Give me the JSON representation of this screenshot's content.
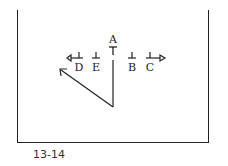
{
  "diagram": {
    "caption": "13-14",
    "players": [
      {
        "label": "A",
        "x": 113,
        "y": 43,
        "marker": "T"
      },
      {
        "label": "D",
        "x": 79,
        "y": 71,
        "marker": "⊥"
      },
      {
        "label": "E",
        "x": 96,
        "y": 71,
        "marker": "⊥"
      },
      {
        "label": "B",
        "x": 132,
        "y": 71,
        "marker": "⊥"
      },
      {
        "label": "C",
        "x": 150,
        "y": 71,
        "marker": "⊥"
      }
    ],
    "colors": {
      "line": "#222222",
      "background": "#ffffff"
    }
  }
}
